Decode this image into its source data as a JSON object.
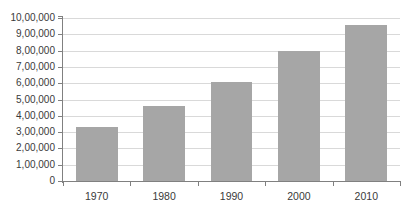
{
  "chart_data": {
    "type": "bar",
    "title": "",
    "subtitle": "",
    "xlabel": "",
    "ylabel": "",
    "categories": [
      "1970",
      "1980",
      "1990",
      "2000",
      "2010"
    ],
    "values": [
      330000,
      460000,
      610000,
      800000,
      960000
    ],
    "series": [
      {
        "name": "Population",
        "values": [
          330000,
          460000,
          610000,
          800000,
          960000
        ]
      }
    ],
    "ylim": [
      0,
      1000000
    ],
    "y_tick_values": [
      0,
      100000,
      200000,
      300000,
      400000,
      500000,
      600000,
      700000,
      800000,
      900000,
      1000000
    ],
    "y_tick_labels": [
      "0",
      "1,00,000",
      "2,00,000",
      "3,00,000",
      "4,00,000",
      "5,00,000",
      "6,00,000",
      "7,00,000",
      "8,00,000",
      "9,00,000",
      "10,00,000"
    ],
    "x_tick_labels": [
      "1970",
      "1980",
      "1990",
      "2000",
      "2010"
    ],
    "grid": true,
    "grid_axis": "y",
    "legend": false,
    "legend_position": "none",
    "annotations": [],
    "colors": {
      "bar_fill": "#a6a6a6",
      "gridline": "#d9d9d9",
      "axis_line": "#808080",
      "tick_text": "#3a3a3a",
      "background": "#ffffff"
    }
  },
  "y_axis": {
    "labels": [
      "10,00,000",
      "9,00,000",
      "8,00,000",
      "7,00,000",
      "6,00,000",
      "5,00,000",
      "4,00,000",
      "3,00,000",
      "2,00,000",
      "1,00,000",
      "0"
    ]
  },
  "x_axis": {
    "labels": [
      "1970",
      "1980",
      "1990",
      "2000",
      "2010"
    ]
  }
}
